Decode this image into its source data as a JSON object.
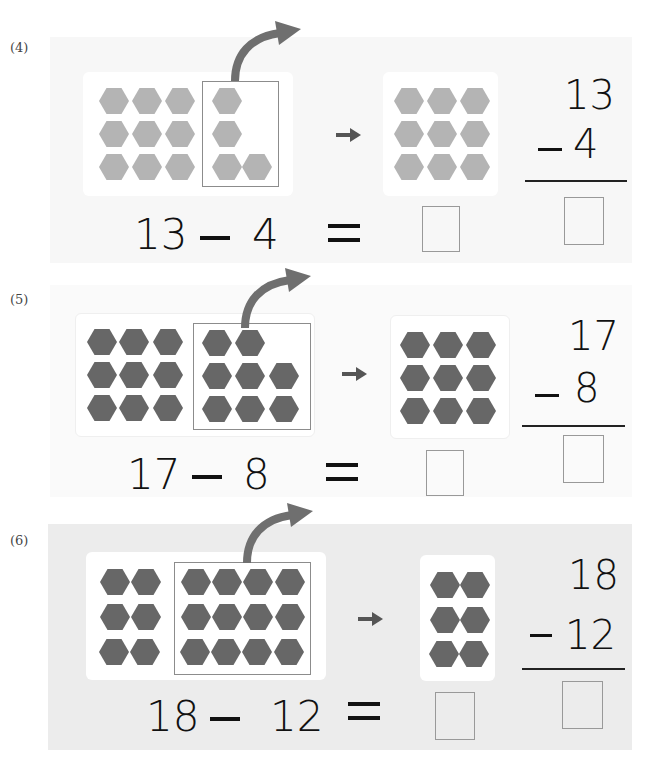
{
  "colors": {
    "hex_light": "#b4b4b4",
    "hex_dark": "#676767",
    "arrow": "#6f6f6f",
    "panel4_bg": "#f7f7f7",
    "panel5_bg": "#fafafa",
    "panel6_bg": "#ececec"
  },
  "problems": [
    {
      "label": "(4)",
      "minuend": "13",
      "subtrahend": "4",
      "equation": {
        "a": "13",
        "op": "—",
        "b": "4",
        "eq": "="
      },
      "vertical": {
        "top": "13",
        "op": "–",
        "bottom": "4"
      },
      "answer": "",
      "left_group_count": 9,
      "taken_count": 4,
      "remaining_count": 9
    },
    {
      "label": "(5)",
      "minuend": "17",
      "subtrahend": "8",
      "equation": {
        "a": "17",
        "op": "—",
        "b": "8",
        "eq": "="
      },
      "vertical": {
        "top": "17",
        "op": "–",
        "bottom": "8"
      },
      "answer": "",
      "left_group_count": 9,
      "taken_count": 8,
      "remaining_count": 9
    },
    {
      "label": "(6)",
      "minuend": "18",
      "subtrahend": "12",
      "equation": {
        "a": "18",
        "op": "—",
        "b": "12",
        "eq": "="
      },
      "vertical": {
        "top": "18",
        "op": "–",
        "bottom": "12"
      },
      "answer": "",
      "left_group_count": 6,
      "taken_count": 12,
      "remaining_count": 6
    }
  ],
  "icons": {
    "take_away_arrow": "curved-arrow",
    "result_arrow": "right-arrow"
  }
}
